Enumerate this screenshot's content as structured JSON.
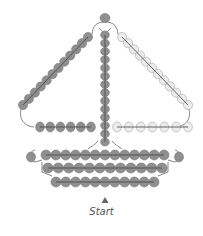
{
  "diagram": {
    "start_label": "Start",
    "start_marker_icon": "triangle-up-icon",
    "colors": {
      "dark_bead": "#8f8f8f",
      "dark_bead_stroke": "#7a7a7a",
      "light_bead": "#ececec",
      "light_bead_stroke": "#a8a8a8",
      "thread": "#555555",
      "text": "#555555"
    },
    "parts": {
      "top_bead": {
        "count": 1,
        "color": "dark"
      },
      "mast": {
        "count": 14,
        "color": "dark"
      },
      "left_sail_edge": {
        "count": 12,
        "color": "dark"
      },
      "right_sail_edge": {
        "count": 12,
        "color": "light"
      },
      "left_boom": {
        "count": 6,
        "color": "dark"
      },
      "right_boom": {
        "count": 7,
        "color": "light"
      },
      "hull_row_1": {
        "count": 13,
        "color": "dark",
        "end_beads": 2
      },
      "hull_row_2": {
        "count": 12,
        "color": "dark"
      },
      "hull_row_3": {
        "count": 11,
        "color": "dark"
      }
    }
  }
}
